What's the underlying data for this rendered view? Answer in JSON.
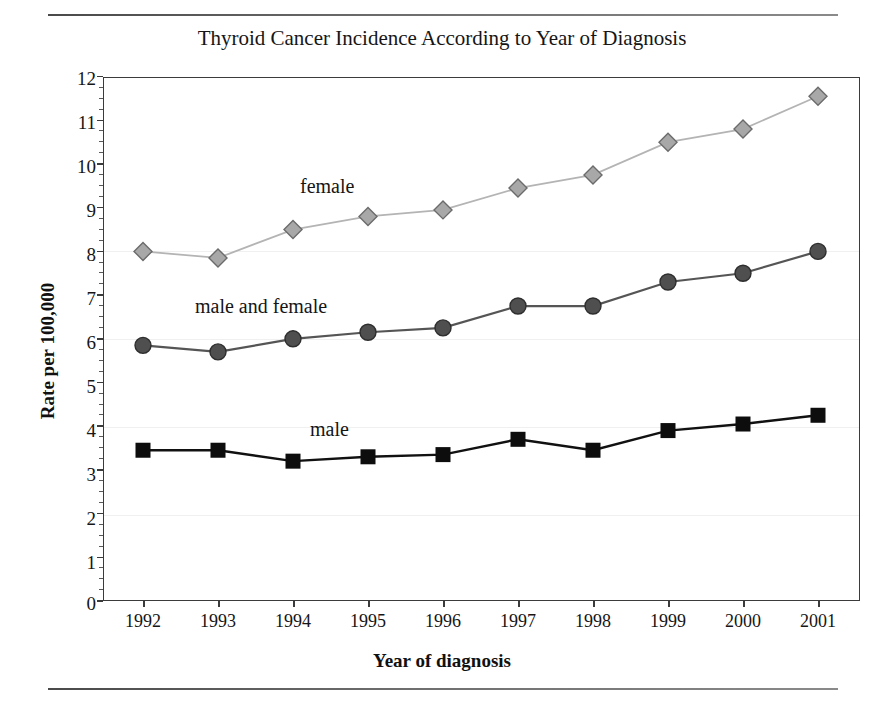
{
  "chart_data": {
    "type": "line",
    "title": "Thyroid Cancer Incidence According to Year of Diagnosis",
    "xlabel": "Year of diagnosis",
    "ylabel": "Rate per 100,000",
    "x": [
      1992,
      1993,
      1994,
      1995,
      1996,
      1997,
      1998,
      1999,
      2000,
      2001
    ],
    "xtick_labels": [
      "1992",
      "1993",
      "1994",
      "1995",
      "1996",
      "1997",
      "1998",
      "1999",
      "2000",
      "2001"
    ],
    "ytick_labels": [
      "0",
      "1",
      "2",
      "3",
      "4",
      "5",
      "6",
      "7",
      "8",
      "9",
      "10",
      "11",
      "12"
    ],
    "ylim": [
      0,
      12
    ],
    "grid": false,
    "legend_position": "inline-annotations",
    "series": [
      {
        "name": "female",
        "marker": "diamond",
        "color": "#9a9a9a",
        "line_color": "#b4b4b4",
        "values": [
          8.0,
          7.85,
          8.5,
          8.8,
          8.95,
          9.45,
          9.75,
          10.5,
          10.8,
          11.55
        ]
      },
      {
        "name": "male and female",
        "marker": "circle",
        "color": "#4a4a4a",
        "line_color": "#555555",
        "values": [
          5.85,
          5.7,
          6.0,
          6.15,
          6.25,
          6.75,
          6.75,
          7.3,
          7.5,
          8.0
        ]
      },
      {
        "name": "male",
        "marker": "square",
        "color": "#0d0d0d",
        "line_color": "#111111",
        "values": [
          3.45,
          3.45,
          3.2,
          3.3,
          3.35,
          3.7,
          3.45,
          3.9,
          4.05,
          4.25
        ]
      }
    ],
    "annotations": [
      {
        "text": "female",
        "series": "female"
      },
      {
        "text": "male and female",
        "series": "male and female"
      },
      {
        "text": "male",
        "series": "male"
      }
    ]
  },
  "page": {
    "cut_caption": ""
  }
}
